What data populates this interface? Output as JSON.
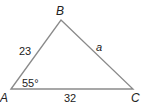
{
  "diagram": {
    "type": "triangle",
    "vertices": {
      "A": {
        "label": "A",
        "x": 11,
        "y": 89
      },
      "B": {
        "label": "B",
        "x": 61,
        "y": 20
      },
      "C": {
        "label": "C",
        "x": 133,
        "y": 89
      }
    },
    "sides": {
      "AB": {
        "label": "23"
      },
      "BC": {
        "label": "a"
      },
      "AC": {
        "label": "32"
      }
    },
    "angles": {
      "A": {
        "label": "55°"
      }
    },
    "colors": {
      "stroke": "#8a8a8a",
      "text": "#222222"
    }
  }
}
